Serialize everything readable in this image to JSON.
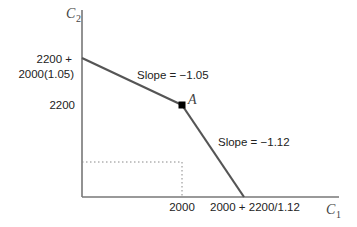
{
  "diagram": {
    "type": "intertemporal budget constraint",
    "axes": {
      "x": {
        "label": "C",
        "subscript": "1"
      },
      "y": {
        "label": "C",
        "subscript": "2"
      }
    },
    "y_ticks": {
      "top_line1": "2200 +",
      "top_line2": "2000(1.05)",
      "mid": "2200"
    },
    "x_ticks": {
      "mid": "2000",
      "right": "2000 + 2200/1.12"
    },
    "point": {
      "label": "A"
    },
    "slopes": {
      "upper": "Slope = −1.05",
      "lower": "Slope = −1.12"
    },
    "colors": {
      "axis": "#777777",
      "line": "#555555",
      "point": "#000000",
      "dotted": "#888888"
    }
  }
}
